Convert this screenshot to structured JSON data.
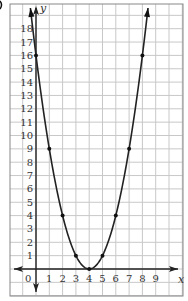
{
  "chart_data": {
    "type": "line",
    "title": "",
    "xlabel": "x",
    "ylabel": "y",
    "equation_implied": "y = (x - 4)^2",
    "x": [
      0,
      1,
      2,
      3,
      4,
      5,
      6,
      7,
      8
    ],
    "series": [
      {
        "name": "parabola",
        "values": [
          16,
          9,
          4,
          1,
          0,
          1,
          4,
          9,
          16
        ],
        "color": "#222222"
      }
    ],
    "x_ticks": [
      "1",
      "2",
      "3",
      "4",
      "5",
      "6",
      "7",
      "8",
      "9"
    ],
    "y_ticks": [
      "1",
      "2",
      "3",
      "4",
      "5",
      "6",
      "7",
      "8",
      "9",
      "10",
      "11",
      "12",
      "13",
      "14",
      "15",
      "16",
      "17",
      "18"
    ],
    "origin_label": "0",
    "xlim": [
      -1,
      10
    ],
    "ylim": [
      -2,
      19
    ],
    "grid": true,
    "legend": null,
    "arrows": {
      "x_axis": "both",
      "y_axis": "both",
      "curve": "both_ends"
    }
  },
  "panel_label": "b"
}
